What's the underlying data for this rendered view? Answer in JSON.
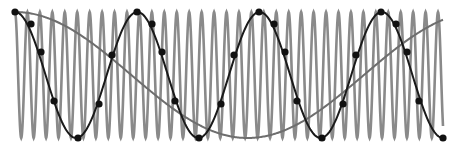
{
  "diagram": {
    "title": "",
    "colors": {
      "background": "#ffffff",
      "high_freq_wave": "#8a8a8a",
      "alias_curve": "#1a1a1a",
      "slow_curve": "#6e6e6e",
      "sample_dots": "#111111"
    },
    "geometry": {
      "x_start": 15,
      "x_end": 443,
      "y_top": 12,
      "y_bottom": 138
    },
    "high_freq_wave": {
      "cycles": 34.4
    },
    "alias_curve": {
      "cycles": 3.0,
      "phase": "starts-at-peak"
    },
    "slow_curve": {
      "cycles": 1.0,
      "phase": "starts-at-peak-ends-at-peak-ish"
    },
    "sample_points": [
      [
        15,
        12
      ],
      [
        31,
        24
      ],
      [
        41,
        52
      ],
      [
        54,
        101
      ],
      [
        78,
        138
      ],
      [
        99,
        104
      ],
      [
        112,
        55
      ],
      [
        137,
        12
      ],
      [
        152,
        24
      ],
      [
        162,
        52
      ],
      [
        175,
        101
      ],
      [
        199,
        138
      ],
      [
        221,
        104
      ],
      [
        234,
        55
      ],
      [
        259,
        12
      ],
      [
        274,
        24
      ],
      [
        285,
        52
      ],
      [
        297,
        101
      ],
      [
        322,
        138
      ],
      [
        343,
        104
      ],
      [
        356,
        55
      ],
      [
        381,
        12
      ],
      [
        396,
        24
      ],
      [
        407,
        52
      ],
      [
        419,
        101
      ],
      [
        443,
        138
      ]
    ]
  }
}
